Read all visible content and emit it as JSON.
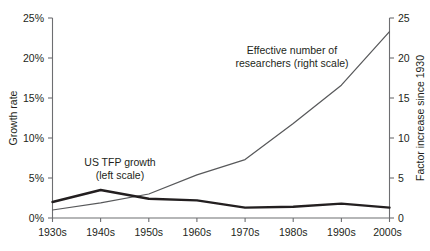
{
  "chart_data": {
    "type": "line",
    "title": "",
    "subtitle": "",
    "x": [
      "1930s",
      "1940s",
      "1950s",
      "1960s",
      "1970s",
      "1980s",
      "1990s",
      "2000s"
    ],
    "categories": [
      "1930s",
      "1940s",
      "1950s",
      "1960s",
      "1970s",
      "1980s",
      "1990s",
      "2000s"
    ],
    "xlabel": "",
    "grid": false,
    "legend_position": "inline-annotations",
    "series": [
      {
        "name": "US TFP growth (left scale)",
        "axis": "left",
        "style": "thick-black",
        "color": "#231f20",
        "values": [
          2.0,
          3.5,
          2.4,
          2.2,
          1.3,
          1.4,
          1.8,
          1.3
        ]
      },
      {
        "name": "Effective number of researchers (right scale)",
        "axis": "right",
        "style": "thin-gray",
        "color": "#58595b",
        "values": [
          1.0,
          1.9,
          3.0,
          5.4,
          7.3,
          11.8,
          16.6,
          23.3
        ]
      }
    ],
    "left_axis": {
      "label": "Growth rate",
      "ticks": [
        0,
        5,
        10,
        15,
        20,
        25
      ],
      "tick_labels": [
        "0%",
        "5%",
        "10%",
        "15%",
        "20%",
        "25%"
      ],
      "ylim": [
        0,
        25
      ]
    },
    "right_axis": {
      "label": "Factor increase since 1930",
      "ticks": [
        0,
        5,
        10,
        15,
        20,
        25
      ],
      "tick_labels": [
        "0",
        "5",
        "10",
        "15",
        "20",
        "25"
      ],
      "ylim": [
        0,
        25
      ]
    },
    "annotations": [
      {
        "id": "tfp",
        "lines": [
          "US TFP growth",
          "(left scale)"
        ],
        "x": 120,
        "y": 166
      },
      {
        "id": "researchers",
        "lines": [
          "Effective number of",
          "researchers (right scale)"
        ],
        "x": 292,
        "y": 54
      }
    ]
  }
}
